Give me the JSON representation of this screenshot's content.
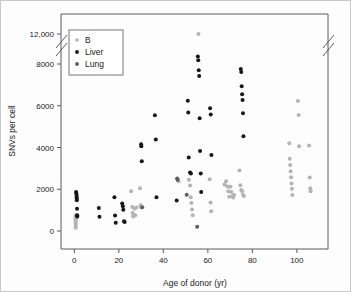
{
  "figure": {
    "background": "#fdfdfd",
    "frame_color": "#5a5a5a",
    "axis_break_note": "double-slash break on y-axis between 8000 and 12,000, repeated on right frame edge"
  },
  "chart_data": {
    "type": "scatter",
    "title": "",
    "xlabel": "Age of donor (yr)",
    "ylabel": "SNVs per cell",
    "xlim": [
      -6,
      114
    ],
    "ylim": [
      -400,
      12600
    ],
    "xticks": [
      0,
      20,
      40,
      60,
      80,
      100
    ],
    "xtick_labels": [
      "0",
      "20",
      "40",
      "60",
      "80",
      "100"
    ],
    "yticks": [
      0,
      2000,
      4000,
      6000,
      8000,
      12000
    ],
    "ytick_labels": [
      "0",
      "2000",
      "4000",
      "6000",
      "8000",
      "12,000"
    ],
    "grid": false,
    "y_axis_break": {
      "between": [
        8000,
        12000
      ],
      "style": "double-slash"
    },
    "legend": {
      "position": "upper-left-inside",
      "entries": [
        {
          "name": "B",
          "color": "#b4b4b4"
        },
        {
          "name": "Liver",
          "color": "#161616"
        },
        {
          "name": "Lung",
          "color": "#5e5e5e"
        }
      ]
    },
    "series": [
      {
        "name": "B",
        "color": "#b4b4b4",
        "points": [
          [
            0.6,
            760
          ],
          [
            0.6,
            700
          ],
          [
            0.6,
            640
          ],
          [
            0.6,
            560
          ],
          [
            0.6,
            470
          ],
          [
            0.6,
            380
          ],
          [
            0.6,
            300
          ],
          [
            0.6,
            210
          ],
          [
            0.6,
            150
          ],
          [
            1.2,
            720
          ],
          [
            25.5,
            1900
          ],
          [
            26.0,
            1150
          ],
          [
            26.2,
            860
          ],
          [
            26.4,
            700
          ],
          [
            27.0,
            1080
          ],
          [
            27.4,
            760
          ],
          [
            28.0,
            1120
          ],
          [
            29.5,
            2050
          ],
          [
            29.8,
            1230
          ],
          [
            30.2,
            1130
          ],
          [
            46.5,
            2460
          ],
          [
            46.8,
            2380
          ],
          [
            51.5,
            2460
          ],
          [
            52.0,
            2180
          ],
          [
            52.3,
            1620
          ],
          [
            52.6,
            1340
          ],
          [
            52.9,
            1030
          ],
          [
            53.2,
            760
          ],
          [
            55.8,
            12000
          ],
          [
            60.8,
            2480
          ],
          [
            61.2,
            1360
          ],
          [
            61.5,
            950
          ],
          [
            67.5,
            2230
          ],
          [
            68.2,
            2380
          ],
          [
            68.8,
            2130
          ],
          [
            69.2,
            1900
          ],
          [
            69.6,
            1640
          ],
          [
            70.2,
            2120
          ],
          [
            70.6,
            1870
          ],
          [
            71.0,
            1660
          ],
          [
            71.4,
            1610
          ],
          [
            71.8,
            1720
          ],
          [
            74.2,
            2900
          ],
          [
            74.6,
            2190
          ],
          [
            75.0,
            1970
          ],
          [
            75.4,
            1900
          ],
          [
            75.8,
            1740
          ],
          [
            76.2,
            1680
          ],
          [
            96.6,
            4200
          ],
          [
            96.8,
            3460
          ],
          [
            97.0,
            3160
          ],
          [
            97.2,
            2860
          ],
          [
            97.4,
            2580
          ],
          [
            97.6,
            2280
          ],
          [
            97.8,
            2020
          ],
          [
            98.0,
            1730
          ],
          [
            100.5,
            6230
          ],
          [
            100.8,
            5560
          ],
          [
            101.0,
            4060
          ],
          [
            105.5,
            4100
          ],
          [
            105.8,
            2560
          ],
          [
            106.0,
            2050
          ],
          [
            106.2,
            1900
          ]
        ]
      },
      {
        "name": "Liver",
        "color": "#161616",
        "points": [
          [
            0.8,
            1870
          ],
          [
            0.9,
            1800
          ],
          [
            1.0,
            1700
          ],
          [
            1.0,
            1600
          ],
          [
            1.1,
            1540
          ],
          [
            1.1,
            1470
          ],
          [
            1.2,
            1060
          ],
          [
            1.3,
            760
          ],
          [
            1.3,
            700
          ],
          [
            11.0,
            1100
          ],
          [
            11.3,
            680
          ],
          [
            18.0,
            1620
          ],
          [
            18.3,
            740
          ],
          [
            18.6,
            400
          ],
          [
            21.5,
            1320
          ],
          [
            21.8,
            1180
          ],
          [
            22.0,
            1020
          ],
          [
            22.3,
            470
          ],
          [
            22.6,
            430
          ],
          [
            30.0,
            4150
          ],
          [
            30.1,
            4060
          ],
          [
            30.3,
            3340
          ],
          [
            36.2,
            5540
          ],
          [
            36.6,
            4380
          ],
          [
            36.9,
            1620
          ],
          [
            46.0,
            1460
          ],
          [
            51.0,
            6240
          ],
          [
            51.2,
            5680
          ],
          [
            51.4,
            3520
          ],
          [
            52.0,
            2800
          ],
          [
            52.4,
            2760
          ],
          [
            55.5,
            9000
          ],
          [
            55.7,
            8500
          ],
          [
            55.9,
            7700
          ],
          [
            56.1,
            7420
          ],
          [
            56.3,
            5400
          ],
          [
            56.5,
            3830
          ],
          [
            56.8,
            2760
          ],
          [
            57.0,
            1870
          ],
          [
            61.0,
            5880
          ],
          [
            61.3,
            5580
          ],
          [
            61.6,
            3640
          ],
          [
            74.8,
            7760
          ],
          [
            75.0,
            7620
          ],
          [
            75.2,
            6930
          ],
          [
            75.4,
            6550
          ],
          [
            75.6,
            6280
          ],
          [
            75.8,
            5640
          ],
          [
            76.0,
            4540
          ]
        ]
      },
      {
        "name": "Lung",
        "color": "#5e5e5e",
        "points": [
          [
            30.5,
            1140
          ],
          [
            46.2,
            2520
          ],
          [
            46.4,
            2450
          ],
          [
            50.5,
            1740
          ],
          [
            55.2,
            205
          ]
        ]
      }
    ]
  }
}
